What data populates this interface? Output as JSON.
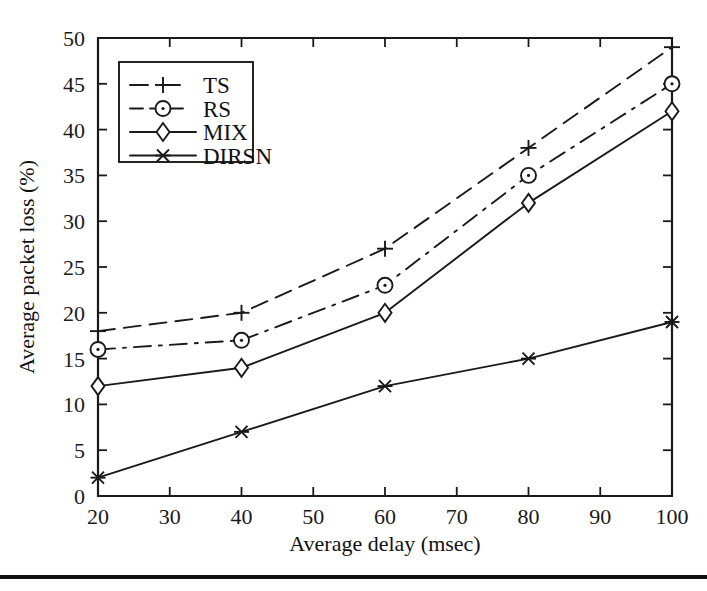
{
  "chart_data": {
    "type": "line",
    "title": "",
    "xlabel": "Average delay (msec)",
    "ylabel": "Average packet loss (%)",
    "x": [
      20,
      40,
      60,
      80,
      100
    ],
    "xlim": [
      20,
      100
    ],
    "ylim": [
      0,
      50
    ],
    "xticks": [
      20,
      30,
      40,
      50,
      60,
      70,
      80,
      90,
      100
    ],
    "yticks": [
      0,
      5,
      10,
      15,
      20,
      25,
      30,
      35,
      40,
      45,
      50
    ],
    "xticklabels": [
      "20",
      "30",
      "40",
      "50",
      "60",
      "70",
      "80",
      "90",
      "100"
    ],
    "yticklabels": [
      "0",
      "5",
      "10",
      "15",
      "20",
      "25",
      "30",
      "35",
      "40",
      "45",
      "50"
    ],
    "grid": false,
    "legend_position": "upper left",
    "series": [
      {
        "name": "TS",
        "values": [
          18,
          20,
          27,
          38,
          49
        ],
        "marker": "plus",
        "linestyle": "dashed",
        "color": "#1a1a1a"
      },
      {
        "name": "RS",
        "values": [
          16,
          17,
          23,
          35,
          45
        ],
        "marker": "circle-dot",
        "linestyle": "dashdot",
        "color": "#1a1a1a"
      },
      {
        "name": "MIX",
        "values": [
          12,
          14,
          20,
          32,
          42
        ],
        "marker": "diamond",
        "linestyle": "solid",
        "color": "#1a1a1a"
      },
      {
        "name": "DIRSN",
        "values": [
          2,
          7,
          12,
          15,
          19
        ],
        "marker": "x-star",
        "linestyle": "solid",
        "color": "#1a1a1a"
      }
    ]
  },
  "legend": {
    "items": [
      {
        "label": "TS"
      },
      {
        "label": "RS"
      },
      {
        "label": "MIX"
      },
      {
        "label": "DIRSN"
      }
    ]
  },
  "axes": {
    "x_title": "Average delay (msec)",
    "y_title": "Average packet loss (%)"
  },
  "colors": {
    "ink": "#1a1a1a",
    "background": "#ffffff",
    "rule": "#111111"
  }
}
